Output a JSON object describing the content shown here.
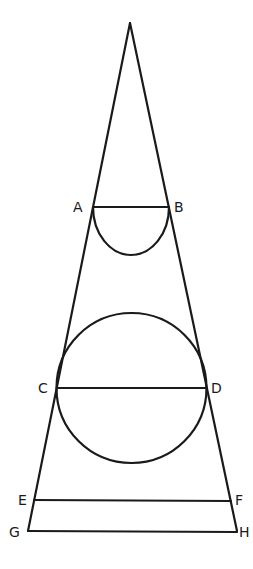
{
  "diagram": {
    "type": "geometry",
    "stroke_color": "#1a1a1a",
    "background": "#ffffff",
    "apex": {
      "x": 130,
      "y": 23
    },
    "points": {
      "A": {
        "label": "A",
        "x": 93,
        "y": 207
      },
      "B": {
        "label": "B",
        "x": 169,
        "y": 207
      },
      "C": {
        "label": "C",
        "x": 57,
        "y": 388
      },
      "D": {
        "label": "D",
        "x": 206,
        "y": 388
      },
      "E": {
        "label": "E",
        "x": 34,
        "y": 500
      },
      "F": {
        "label": "F",
        "x": 231,
        "y": 500
      },
      "G": {
        "label": "G",
        "x": 28,
        "y": 531
      },
      "H": {
        "label": "H",
        "x": 237,
        "y": 531
      }
    },
    "segments": [
      "AB",
      "CD",
      "EF",
      "GH"
    ],
    "semicircle": {
      "on": "AB",
      "direction": "below"
    },
    "circle": {
      "diameter": "CD",
      "cx": 131,
      "cy": 388,
      "r": 75
    }
  },
  "labels": {
    "A": "A",
    "B": "B",
    "C": "C",
    "D": "D",
    "E": "E",
    "F": "F",
    "G": "G",
    "H": "H"
  }
}
